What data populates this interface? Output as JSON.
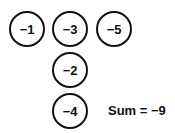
{
  "diagram": {
    "background_color": "#ffffff",
    "stroke_color": "#111111",
    "text_color": "#111111",
    "top_row": [
      {
        "value": "−1"
      },
      {
        "value": "−3"
      },
      {
        "value": "−5"
      }
    ],
    "stacked_column": [
      {
        "value": "−2"
      },
      {
        "value": "−4"
      }
    ],
    "sum": {
      "text": "Sum = −9"
    }
  }
}
